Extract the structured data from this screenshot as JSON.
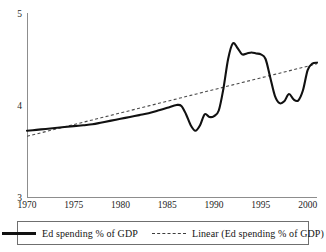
{
  "chart_data": {
    "type": "line",
    "title": "",
    "xlabel": "",
    "ylabel": "",
    "xlim": [
      1970,
      2001
    ],
    "ylim": [
      3,
      5
    ],
    "grid": false,
    "legend_position": "bottom",
    "x_ticks": [
      "1970",
      "1975",
      "1980",
      "1985",
      "1990",
      "1995",
      "2000"
    ],
    "x_tick_values": [
      1970,
      1975,
      1980,
      1985,
      1990,
      1995,
      2000
    ],
    "y_ticks": [
      "3",
      "4",
      "5"
    ],
    "y_tick_values": [
      3,
      4,
      5
    ],
    "x": [
      1970,
      1971,
      1972,
      1973,
      1974,
      1975,
      1976,
      1977,
      1978,
      1979,
      1980,
      1981,
      1982,
      1983,
      1984,
      1985,
      1986,
      1986.5,
      1987,
      1987.5,
      1988,
      1988.5,
      1989,
      1989.5,
      1990,
      1990.5,
      1991,
      1991.5,
      1992,
      1992.5,
      1993,
      1993.5,
      1994,
      1994.5,
      1995,
      1995.5,
      1996,
      1996.5,
      1997,
      1997.5,
      1998,
      1998.5,
      1999,
      1999.5,
      2000,
      2000.5,
      2001
    ],
    "series": [
      {
        "name": "Ed spending % of GDP",
        "style": "solid",
        "values": [
          3.72,
          3.73,
          3.74,
          3.75,
          3.76,
          3.77,
          3.78,
          3.79,
          3.81,
          3.83,
          3.85,
          3.87,
          3.89,
          3.91,
          3.94,
          3.97,
          4.0,
          3.99,
          3.9,
          3.78,
          3.72,
          3.78,
          3.9,
          3.87,
          3.88,
          3.94,
          4.18,
          4.5,
          4.67,
          4.62,
          4.55,
          4.56,
          4.57,
          4.56,
          4.55,
          4.5,
          4.3,
          4.1,
          4.02,
          4.04,
          4.12,
          4.06,
          4.05,
          4.16,
          4.38,
          4.45,
          4.46
        ]
      },
      {
        "name": "Linear (Ed spending % of GDP)",
        "style": "dashed",
        "values": [
          3.66,
          3.6854,
          3.7108,
          3.7362,
          3.7616,
          3.787,
          3.8124,
          3.8378,
          3.8632,
          3.8886,
          3.914,
          3.9394,
          3.9648,
          3.9902,
          4.0156,
          4.041,
          4.0664,
          4.0791,
          4.0918,
          4.1045,
          4.1172,
          4.1299,
          4.1426,
          4.1553,
          4.168,
          4.1807,
          4.1934,
          4.2061,
          4.2188,
          4.2315,
          4.2442,
          4.2569,
          4.2696,
          4.2823,
          4.295,
          4.3077,
          4.3204,
          4.3331,
          4.3458,
          4.3585,
          4.3712,
          4.3839,
          4.3966,
          4.4093,
          4.422,
          4.4347,
          4.4474
        ]
      }
    ],
    "colors": {
      "series_solid": "#111111",
      "series_dashed": "#4a4a4a",
      "axis": "#8d8d8d",
      "text": "#1a1a1a",
      "background": "#ffffff",
      "legend_border": "#6f6f6f"
    }
  },
  "legend": {
    "entries": [
      {
        "label": "Ed spending % of GDP",
        "style": "solid"
      },
      {
        "label": "Linear (Ed spending % of GDP)",
        "style": "dashed"
      }
    ]
  }
}
